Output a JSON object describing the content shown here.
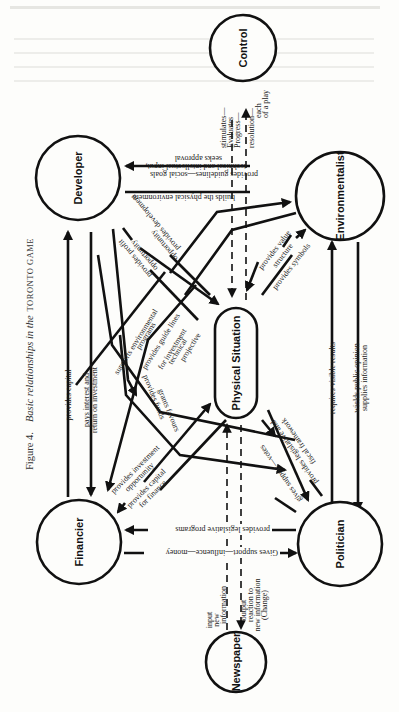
{
  "figure": {
    "caption_prefix": "Figure 4.",
    "caption_italic": "Basic relationships in the",
    "caption_smallcaps": "TORONTO GAME"
  },
  "nodes": {
    "control": "Control",
    "developer": "Developer",
    "environmentalist": "Environmentalist",
    "physical_situation": "Physical Situation",
    "financier": "Financier",
    "politician": "Politician",
    "newspaper": "Newspaper"
  },
  "edges": {
    "control_in_1": "stimulates—",
    "control_in_2": "Evaluates",
    "control_in_3": "Progress—",
    "control_out_1": "resolution—",
    "control_out_2": "each",
    "control_out_3": "of a play",
    "env_dev_1": "provides guidelines—social goals",
    "env_dev_2": "technical and intellectual input,",
    "env_dev_3": "seeks approval",
    "dev_env": "builds the physical environment",
    "dev_opportunity_1": "provides development",
    "dev_opportunity_2": "opportunity",
    "dev_profit_1": "provides profit",
    "dev_profit_2": "opportunity",
    "env_value_1": "provides value",
    "env_value_2": "structure",
    "env_symbols": "provides symbols",
    "supports_env_1": "supports environmental",
    "supports_env_2": "programs",
    "guide_lines_1": "provides guide lines",
    "guide_lines_2": "for investment",
    "guide_lines_3": "technical",
    "guide_lines_4": "projective",
    "provides_capital": "provides capital",
    "pays_interest_1": "pays interest and",
    "pays_interest_2": "return on investment",
    "provides_funds": "provides funds",
    "grants_favours": "grants favours",
    "investment_opp_1": "provides investment",
    "investment_opp_2": "opportunity",
    "capital_finance_1": "provides capital",
    "capital_finance_2": "for finance",
    "gives_votes": "gives support—votes",
    "legislative_framework_1": "provides legislative and",
    "legislative_framework_2": "fiscal framework",
    "requires_results": "requires visible results",
    "public_opinion_1": "wields public opinion",
    "public_opinion_2": "supplies information",
    "legislative_programs": "provides legislative programs",
    "gives_money": "Gives support—influence—money",
    "news_in_1": "input",
    "news_in_2": "new",
    "news_in_3": "information",
    "news_out_1": "output",
    "news_out_2": "reaction to",
    "news_out_3": "new information",
    "news_out_4": "(Change)"
  }
}
